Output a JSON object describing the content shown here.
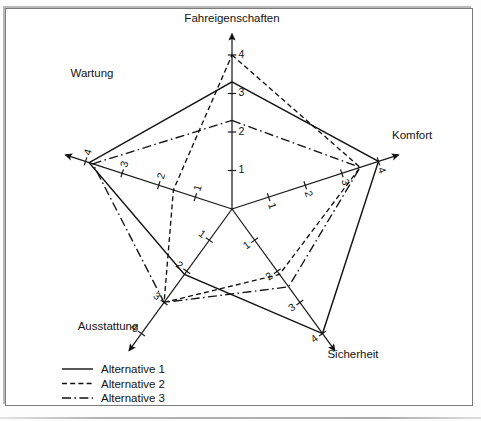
{
  "chart_data": {
    "type": "radar",
    "title": "",
    "categories": [
      "Fahreigenschaften",
      "Komfort",
      "Sicherheit",
      "Ausstattung",
      "Wartung"
    ],
    "axis_max": 4,
    "axis_min": 0,
    "tick_labels": [
      "1",
      "2",
      "3",
      "4"
    ],
    "tick_values": [
      1,
      2,
      3,
      4
    ],
    "grid": false,
    "legend_position": "bottom-left",
    "series": [
      {
        "name": "Alternative 1",
        "style": "solid",
        "values": [
          3.3,
          4.0,
          4.0,
          2.1,
          3.9
        ]
      },
      {
        "name": "Alternative 2",
        "style": "dashed",
        "values": [
          4.0,
          3.5,
          2.1,
          3.0,
          1.6
        ]
      },
      {
        "name": "Alternative 3",
        "style": "dash-dot",
        "values": [
          2.3,
          3.5,
          2.5,
          3.0,
          3.8
        ]
      }
    ]
  },
  "axes": [
    {
      "name": "Fahreigenschaften",
      "label": "Fahreigenschaften",
      "angle_deg": -90,
      "ticks": [
        "1",
        "2",
        "3",
        "4"
      ]
    },
    {
      "name": "Komfort",
      "label": "Komfort",
      "angle_deg": -18,
      "ticks": [
        "1",
        "2",
        "3",
        "4"
      ]
    },
    {
      "name": "Sicherheit",
      "label": "Sicherheit",
      "angle_deg": 54,
      "ticks": [
        "1",
        "2",
        "3",
        "4"
      ]
    },
    {
      "name": "Ausstattung",
      "label": "Ausstattung",
      "angle_deg": 126,
      "ticks": [
        "1",
        "2",
        "3",
        "4"
      ]
    },
    {
      "name": "Wartung",
      "label": "Wartung",
      "angle_deg": -162,
      "ticks": [
        "1",
        "2",
        "3",
        "4"
      ]
    }
  ],
  "legend": {
    "items": [
      {
        "label": "Alternative 1",
        "style": "solid"
      },
      {
        "label": "Alternative 2",
        "style": "dashed"
      },
      {
        "label": "Alternative 3",
        "style": "dash-dot"
      }
    ]
  },
  "colors": {
    "line": "#111111",
    "frame": "#7b7b7b",
    "background": "#ffffff"
  }
}
